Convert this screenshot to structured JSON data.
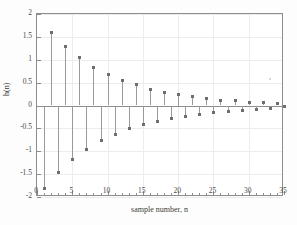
{
  "chart_data": {
    "type": "scatter",
    "plot_style": "stem",
    "title": "",
    "xlabel": "sample number, n",
    "ylabel": "h(n)",
    "xlim": [
      0,
      35
    ],
    "ylim": [
      -2,
      2
    ],
    "xticks": [
      0,
      5,
      10,
      15,
      20,
      25,
      30,
      35
    ],
    "xtick_labels": [
      "0",
      "5",
      "10",
      "15",
      "20",
      "25",
      "30",
      "35"
    ],
    "yticks": [
      -2,
      -1.5,
      -1,
      -0.5,
      0,
      0.5,
      1,
      1.5,
      2
    ],
    "ytick_labels": [
      "-2",
      "-1.5",
      "-1",
      "-0.5",
      "0",
      "0.5",
      "1",
      "1.5",
      "2"
    ],
    "grid": true,
    "legend": null,
    "marker": "dot",
    "line_color": "#9a9a9a",
    "marker_color": "#6e6e6e",
    "axis_color": "#8d8d8d",
    "grid_color": "#ececec",
    "background": "#ffffff",
    "x": [
      1,
      2,
      3,
      4,
      5,
      6,
      7,
      8,
      9,
      10,
      11,
      12,
      13,
      14,
      15,
      16,
      17,
      18,
      19,
      20,
      21,
      22,
      23,
      24,
      25,
      26,
      27,
      28,
      29,
      30,
      31,
      32,
      33,
      34,
      35
    ],
    "values": [
      -1.8,
      1.61,
      -1.45,
      1.3,
      -1.17,
      1.05,
      -0.95,
      0.85,
      -0.76,
      0.68,
      -0.62,
      0.56,
      -0.5,
      0.46,
      -0.41,
      0.37,
      -0.34,
      0.3,
      -0.27,
      0.25,
      -0.22,
      0.2,
      -0.18,
      0.16,
      -0.14,
      0.12,
      -0.11,
      0.11,
      -0.09,
      0.08,
      -0.07,
      0.07,
      -0.06,
      0.05,
      -0.02
    ],
    "series": [
      {
        "name": "h(n)",
        "values": [
          -1.8,
          1.61,
          -1.45,
          1.3,
          -1.17,
          1.05,
          -0.95,
          0.85,
          -0.76,
          0.68,
          -0.62,
          0.56,
          -0.5,
          0.46,
          -0.41,
          0.37,
          -0.34,
          0.3,
          -0.27,
          0.25,
          -0.22,
          0.2,
          -0.18,
          0.16,
          -0.14,
          0.12,
          -0.11,
          0.11,
          -0.09,
          0.08,
          -0.07,
          0.07,
          -0.06,
          0.05,
          -0.02
        ]
      }
    ],
    "artifacts": [
      {
        "name": "noise-speck",
        "x": 32.9,
        "y": 0.6
      }
    ]
  }
}
